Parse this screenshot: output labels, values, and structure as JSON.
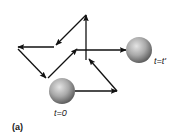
{
  "figure": {
    "panel_label": "(a)",
    "start_label": "t=0",
    "end_label": "t=t'",
    "colors": {
      "arrow": "#111111",
      "sphere_light": "#d8d8d8",
      "sphere_dark": "#6f6f6f",
      "background": "#ffffff"
    },
    "path_steps": [
      {
        "from": [
          75,
          91
        ],
        "to": [
          117,
          91
        ]
      },
      {
        "from": [
          117,
          91
        ],
        "to": [
          89,
          59
        ]
      },
      {
        "from": [
          86,
          60
        ],
        "to": [
          86,
          15
        ]
      },
      {
        "from": [
          86,
          15
        ],
        "to": [
          56,
          45
        ]
      },
      {
        "from": [
          54,
          47
        ],
        "to": [
          18,
          47
        ]
      },
      {
        "from": [
          18,
          49
        ],
        "to": [
          46,
          78
        ]
      },
      {
        "from": [
          48,
          78
        ],
        "to": [
          77,
          49
        ]
      },
      {
        "from": [
          77,
          50
        ],
        "to": [
          126,
          50
        ]
      }
    ]
  }
}
